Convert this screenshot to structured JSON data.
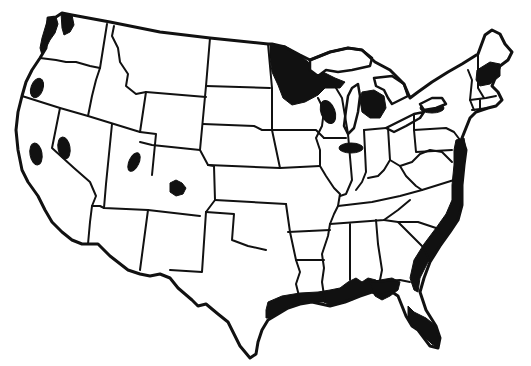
{
  "map": {
    "title": "",
    "subject": "Contiguous United States outline map with state boundaries",
    "colors": {
      "background": "#ffffff",
      "outline": "#111111",
      "highlight": "#111111"
    },
    "highlighted_regions": [
      {
        "id": "puget-sound",
        "label": "Washington coast / Puget Sound"
      },
      {
        "id": "oregon-cascades",
        "label": "Western Oregon"
      },
      {
        "id": "california-valley",
        "label": "California"
      },
      {
        "id": "nevada-west",
        "label": "Western Nevada"
      },
      {
        "id": "utah",
        "label": "Utah"
      },
      {
        "id": "colorado",
        "label": "Colorado"
      },
      {
        "id": "northern-minnesota",
        "label": "Northern Minnesota / Lake Superior shore"
      },
      {
        "id": "wisconsin",
        "label": "Wisconsin"
      },
      {
        "id": "michigan-lower",
        "label": "Lower Michigan"
      },
      {
        "id": "illinois-north",
        "label": "Northern Illinois / Indiana"
      },
      {
        "id": "lake-ontario",
        "label": "Lake Ontario / western New York"
      },
      {
        "id": "new-hampshire-maine",
        "label": "New Hampshire / southern Maine"
      },
      {
        "id": "atlantic-coast",
        "label": "Atlantic coastal plain"
      },
      {
        "id": "gulf-coast",
        "label": "Gulf coast"
      },
      {
        "id": "florida",
        "label": "Florida peninsula"
      }
    ]
  }
}
